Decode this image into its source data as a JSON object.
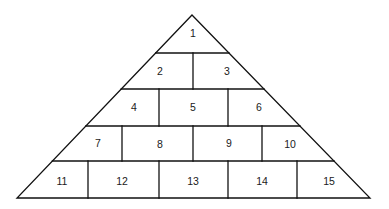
{
  "diagram": {
    "type": "numbered-pyramid",
    "stroke_color": "#111111",
    "background": "#ffffff",
    "apex": [
      192,
      15
    ],
    "base_y": 198,
    "base_left_x": 17,
    "base_right_x": 370,
    "rows": [
      {
        "row": 1,
        "y_top": 15,
        "y_bottom": 53,
        "dividers_x": [],
        "cells": [
          {
            "label": "1",
            "x": 193,
            "y": 37
          }
        ]
      },
      {
        "row": 2,
        "y_top": 53,
        "y_bottom": 89,
        "dividers_x": [
          193
        ],
        "cells": [
          {
            "label": "2",
            "x": 160,
            "y": 75
          },
          {
            "label": "3",
            "x": 227,
            "y": 75
          }
        ]
      },
      {
        "row": 3,
        "y_top": 89,
        "y_bottom": 126,
        "dividers_x": [
          159,
          228
        ],
        "cells": [
          {
            "label": "4",
            "x": 134,
            "y": 111
          },
          {
            "label": "5",
            "x": 193,
            "y": 111
          },
          {
            "label": "6",
            "x": 259,
            "y": 111
          }
        ]
      },
      {
        "row": 4,
        "y_top": 126,
        "y_bottom": 161,
        "dividers_x": [
          122,
          193,
          262
        ],
        "cells": [
          {
            "label": "7",
            "x": 98,
            "y": 147
          },
          {
            "label": "8",
            "x": 160,
            "y": 148
          },
          {
            "label": "9",
            "x": 229,
            "y": 147
          },
          {
            "label": "10",
            "x": 290,
            "y": 148
          }
        ]
      },
      {
        "row": 5,
        "y_top": 161,
        "y_bottom": 198,
        "dividers_x": [
          88,
          159,
          228,
          297
        ],
        "cells": [
          {
            "label": "11",
            "x": 62,
            "y": 185
          },
          {
            "label": "12",
            "x": 122,
            "y": 185
          },
          {
            "label": "13",
            "x": 193,
            "y": 185
          },
          {
            "label": "14",
            "x": 262,
            "y": 185
          },
          {
            "label": "15",
            "x": 329,
            "y": 185
          }
        ]
      }
    ]
  }
}
